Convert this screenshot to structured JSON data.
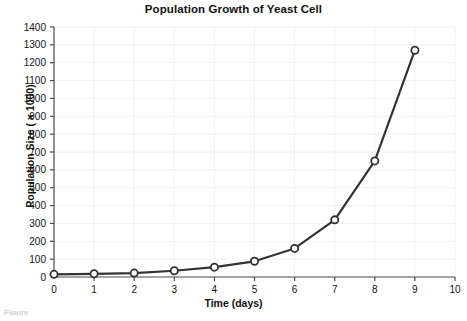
{
  "chart_data": {
    "type": "line",
    "title": "Population Growth of Yeast Cell",
    "xlabel": "Time (days)",
    "ylabel": "Population Size ( × 1000)",
    "xlim": [
      0,
      10
    ],
    "ylim": [
      0,
      1400
    ],
    "x_ticks": [
      0,
      1,
      2,
      3,
      4,
      5,
      6,
      7,
      8,
      9,
      10
    ],
    "y_ticks": [
      0,
      100,
      200,
      300,
      400,
      500,
      600,
      700,
      800,
      900,
      1000,
      1100,
      1200,
      1300,
      1400
    ],
    "grid": true,
    "legend": "none",
    "marker": "open-circle",
    "line_color": "#333333",
    "marker_fill": "#ffffff",
    "grid_color": "#f0f0f0",
    "x": [
      0,
      1,
      2,
      3,
      4,
      5,
      6,
      7,
      8,
      9
    ],
    "values": [
      15,
      18,
      22,
      35,
      55,
      88,
      160,
      320,
      650,
      1270
    ],
    "series": [
      {
        "name": "Yeast population",
        "values": [
          15,
          18,
          22,
          35,
          55,
          88,
          160,
          320,
          650,
          1270
        ]
      }
    ]
  },
  "caption_fragment": "Figure"
}
